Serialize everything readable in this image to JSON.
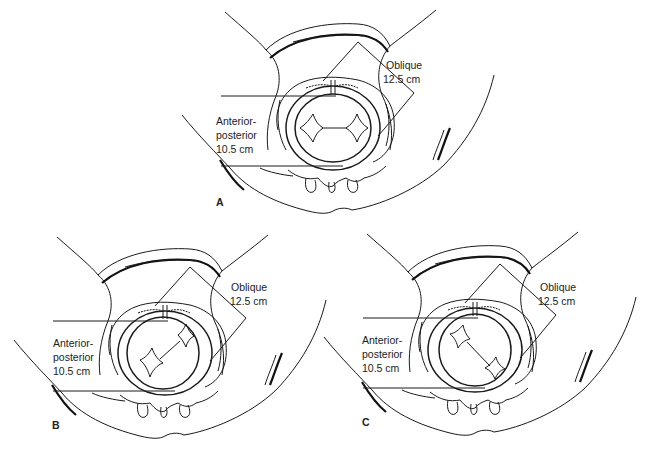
{
  "figure": {
    "panels": [
      {
        "id": "A",
        "letter": "A",
        "oblique_label": "Oblique",
        "oblique_value": "12.5 cm",
        "ap_label_1": "Anterior-",
        "ap_label_2": "posterior",
        "ap_value": "10.5 cm",
        "head_orientation": "transverse"
      },
      {
        "id": "B",
        "letter": "B",
        "oblique_label": "Oblique",
        "oblique_value": "12.5 cm",
        "ap_label_1": "Anterior-",
        "ap_label_2": "posterior",
        "ap_value": "10.5 cm",
        "head_orientation": "oblique-left"
      },
      {
        "id": "C",
        "letter": "C",
        "oblique_label": "Oblique",
        "oblique_value": "12.5 cm",
        "ap_label_1": "Anterior-",
        "ap_label_2": "posterior",
        "ap_value": "10.5 cm",
        "head_orientation": "oblique-right"
      }
    ],
    "colors": {
      "line": "#1a1a1a",
      "background": "#ffffff"
    }
  }
}
